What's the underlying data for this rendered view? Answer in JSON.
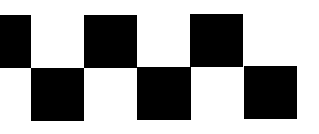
{
  "pattern": {
    "name": "checkered-strip",
    "colors": {
      "fill": "#000000",
      "background": "#ffffff"
    },
    "square_count": 6,
    "rows": [
      "top",
      "bottom",
      "top",
      "bottom",
      "top",
      "bottom"
    ]
  }
}
